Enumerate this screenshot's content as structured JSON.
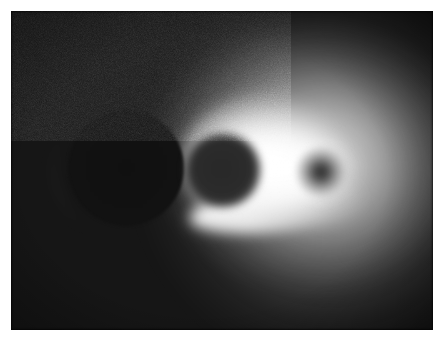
{
  "figure": {
    "caption": "",
    "medium": "photographic-plate",
    "border_color": "#ffffff",
    "plate_background_color": "#161616",
    "highlight_color": "#ffffff",
    "plate": {
      "x": 11,
      "y": 11,
      "width": 422,
      "height": 319
    }
  },
  "features": [
    {
      "name": "large-ring",
      "description": "Large dark disc bounded by a bright thin annulus, at left of frame",
      "center_x": 126,
      "center_y": 168,
      "radius": 62,
      "interior_tone": "dark",
      "rim_tone": "bright"
    },
    {
      "name": "middle-disc",
      "description": "Medium dark disc with soft diffuse edge, embedded in the bright core",
      "center_x": 223,
      "center_y": 170,
      "radius": 37,
      "interior_tone": "dark-gray",
      "rim_tone": "soft"
    },
    {
      "name": "small-spot",
      "description": "Small dark point with radial falloff, right of the middle disc",
      "center_x": 321,
      "center_y": 172,
      "radius": 22,
      "interior_tone": "dark-gray",
      "rim_tone": "soft-bright"
    },
    {
      "name": "bright-core",
      "description": "Saturated white luminous core spanning the middle disc and trailing right",
      "center_x": 263,
      "center_y": 163,
      "tone": "white"
    },
    {
      "name": "outer-halo",
      "description": "Broad diffuse glow fading into the dark background toward the right",
      "center_x": 300,
      "center_y": 160,
      "tone": "gray-gradient"
    },
    {
      "name": "tail-streak",
      "description": "Bright tapering band sweeping down and right from the middle disc",
      "tone": "bright"
    }
  ],
  "appearance": {
    "color_mode": "grayscale",
    "grain": "visible film grain",
    "vignette": "corners darkened"
  }
}
